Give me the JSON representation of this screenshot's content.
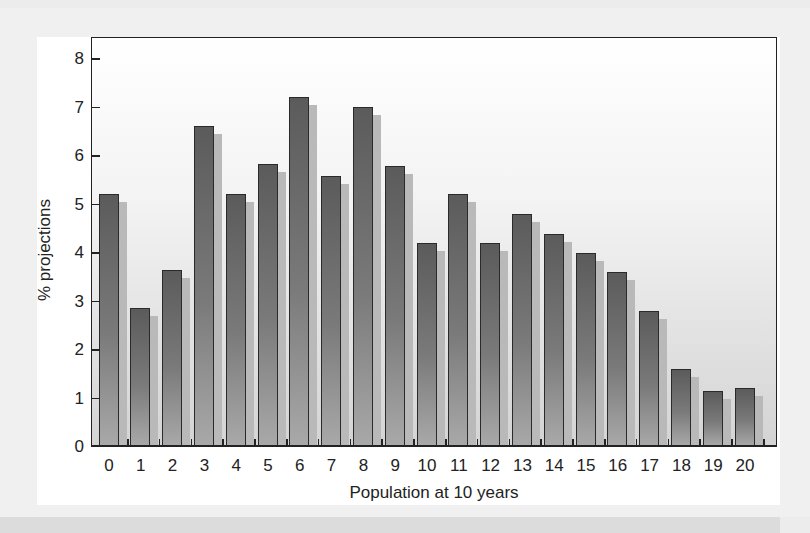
{
  "chart_data": {
    "type": "bar",
    "title": "",
    "xlabel": "Population at 10 years",
    "ylabel": "% projections",
    "categories": [
      "0",
      "1",
      "2",
      "3",
      "4",
      "5",
      "6",
      "7",
      "8",
      "9",
      "10",
      "11",
      "12",
      "13",
      "14",
      "15",
      "16",
      "17",
      "18",
      "19",
      "20"
    ],
    "values": [
      5.2,
      2.85,
      3.63,
      6.6,
      5.2,
      5.83,
      7.2,
      5.57,
      7.0,
      5.79,
      4.19,
      5.2,
      4.19,
      4.8,
      4.39,
      4.0,
      3.59,
      2.8,
      1.59,
      1.15,
      1.2
    ],
    "ylim": [
      0,
      8.2
    ],
    "yticks": [
      "0",
      "1",
      "2",
      "3",
      "4",
      "5",
      "6",
      "7",
      "8"
    ],
    "grid": false,
    "legend": null
  },
  "colors": {
    "bar_top": "#5b5b5b",
    "bar_bottom": "#a9a9a9",
    "shadow": "#b9b9b9",
    "axis": "#222222",
    "panel": "#ffffff",
    "background": "#ececec"
  }
}
